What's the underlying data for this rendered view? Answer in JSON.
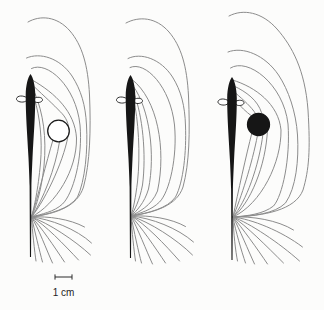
{
  "figure": {
    "background": "#fcfcfb",
    "line_color": "#8c8c8c",
    "line_width": 1,
    "outline_color": "#1a1a1a",
    "fish": {
      "color": "#161616",
      "fin_fill": "#ffffff",
      "body_path": "M 0,0 C 2.6,3.5 4.7,11 4.8,21 C 4.9,40 3.1,62 2,84 C 1.4,97 1.1,104 0.9,112 L 0.55,183 L -0.55,183 L -0.9,112 C -1.1,104 -1.4,97 -2,84 C -3.1,62 -4.9,40 -4.8,21 C -4.7,11 -2.6,3.5 0,0 Z",
      "left_fin_path": "M -3.2,24 C -7.5,21 -13,21.5 -14,24.5 C -14.6,27 -10,28.8 -6.2,27.8 C -4.2,27.2 -3.2,26 -3.2,24 Z",
      "right_fin_path": "M 3.2,24.5 C 7,22.5 11.2,23 12,25.5 C 12.4,27.8 8.2,29.2 5.2,28.2 C 3.8,27.6 3.1,26.3 3.2,24.5 Z"
    },
    "panels": [
      {
        "name": "nonconductive-object",
        "fish": {
          "x": 30.5,
          "y": 74
        },
        "object": {
          "shape": "circle",
          "cx": 58.5,
          "cy": 131,
          "r": 10.8,
          "fill": "#ffffff",
          "stroke": "#1a1a1a"
        },
        "field_lines": [
          "M 34.5,99 C 40,117 42.5,140 40.5,163 C 38,190 34.5,206 31.5,217",
          "M 35,93.5 C 43,113 46.8,137 44,166 C 41,193 35.5,208 31.5,217",
          "M 34.5,87 C 44,96 54,105 60,111.5 C 66,117 69.5,124 68.5,132.5 C 66,155 47,198 31.5,217",
          "M 52.8,140.5 C 46.5,162 38,196 31.5,217",
          "M 59.5,141.8 C 55.5,168 43,200 31.5,217",
          "M 33,80.5 C 55,93 75,112 76.5,138 C 77,170 56,204 31.5,217",
          "M 31.5,68.5 C 47,60.5 76,86 80,125 C 83,158 73,194 62.5,204 C 54,212 41.5,214 31.5,217",
          "M 26.5,58 C 40,52 60,58 72,76 C 81,90 85.5,105 86.5,125 C 88,150 85,181 77.5,197 C 69.5,209 49.5,214 31.5,217",
          "M 28,22 C 40,15 57,16 70,31 C 82,45 88,65 89.5,95 C 91,130 90,163 83.5,187 C 77.5,206 57.5,213.5 31.5,217",
          "M 31.5,217 C 48,216 70,219 84.5,227",
          "M 31.5,217 C 50,219 76.5,229 91.5,243",
          "M 31.5,217 C 48,223 74.5,240 90.5,255",
          "M 31.5,217 C 44.5,224 64.5,245 78.5,260",
          "M 31.5,217 C 40.5,226 54.5,247 64.5,262",
          "M 31.5,217 C 38.5,228 46.5,250 52.5,263",
          "M 31.5,217 C 34.5,230 39.5,251 42.5,262",
          "M 31.5,217 C 32.5,232 34.5,251 36,261"
        ]
      },
      {
        "name": "no-object",
        "fish": {
          "x": 130.5,
          "y": 75
        },
        "object": null,
        "field_lines": [
          "M 133.5,99.5 C 138.5,119 140.5,154 137.5,182 C 135.5,198 133.5,208 131,216",
          "M 134,93.5 C 142.5,115 146.5,154 142.5,185 C 139.5,201 134.5,210 131,216",
          "M 133.5,86.5 C 149.5,109 155.5,154 148.5,189 C 144.5,203 136.5,211 131,216",
          "M 132,79.5 C 157.5,99 166.5,149 157.5,191 C 151.5,206 138.5,212 131,216",
          "M 130,67.5 C 145.5,60.5 170.5,87 174.5,125 C 177.5,157 169.5,192 159.5,202 C 151.5,210 140.5,213 131,216",
          "M 128,58.5 C 141,52 161,59 172.5,77 C 181,90.5 185,106 185.5,126 C 186.5,151 183.5,182 175.5,197 C 167.5,208.5 148.5,213 131,216",
          "M 126,23 C 139,16 156,17 169,32 C 181,46 187,66 188.5,96 C 190,132 189.5,163 183,187 C 177,205 157,212 131,216",
          "M 131,216 C 149.5,215 171.5,218.5 185.5,226.5",
          "M 131,216 C 151.5,218 177.5,228 193.5,242",
          "M 131,216 C 149.5,222 176.5,239 192.5,255",
          "M 131,216 C 144.5,223 165.5,245 179.5,261",
          "M 131,216 C 140.5,226 155.5,248 165.5,263",
          "M 131,216 C 137.5,228 146.5,251 152.5,264",
          "M 131,216 C 134,231 138.5,252 141.5,263",
          "M 131,216 C 132,232 134,251 135.5,261"
        ]
      },
      {
        "name": "conductive-object",
        "fish": {
          "x": 232,
          "y": 77
        },
        "object": {
          "shape": "circle",
          "cx": 258.5,
          "cy": 124.5,
          "r": 11,
          "fill": "#161616",
          "stroke": "#161616"
        },
        "field_lines": [
          "M 235.5,100 C 240.5,107 246.5,112 251,115.5",
          "M 235.5,93 C 243.5,100 251.5,107 255.5,113.5",
          "M 234,86 C 246.5,92 257.5,100 261.5,112.5",
          "M 252,132.5 C 246,156 238,192 233,217",
          "M 257.5,135.3 C 252,164 241,198 233,217",
          "M 263,133.8 C 259,166 246,202 233,217",
          "M 267.5,129.5 C 266,166 250,204 233,217",
          "M 232.5,80 C 255.5,87 278.5,104 281,130 C 281.5,162 261.5,204 233,217",
          "M 230.5,68 C 247.5,57 283.5,84 288,124 C 290.5,158 282.5,196 273.5,206 C 263.5,214 247.5,216 233,217",
          "M 228,52 C 243,46 265,55 278.5,75 C 288.5,90 296,112 297.5,135 C 299,160 296,188 285.5,203 C 274.5,214 252.5,216 233,217",
          "M 229,16 C 243,8.5 262,12 277,29 C 292,46 305,70 308,110 C 310.5,150 309,170 303,190 C 295.5,210 264,216 233,217",
          "M 233,217 C 251.5,216 277.5,220 293.5,230",
          "M 233,217 C 251.5,219 281.5,231 302.5,247",
          "M 233,217 C 249.5,223 279.5,243 299.5,261",
          "M 233,217 C 245.5,225 267.5,247 283.5,263",
          "M 233,217 C 241.5,227 257.5,249 267.5,264",
          "M 233,217 C 239.5,229 248.5,251 254.5,264",
          "M 233,217 C 235.5,231 241.5,251 245.5,263",
          "M 233,217 C 233.5,233 235.5,251 237.5,261"
        ]
      }
    ],
    "scale_bar": {
      "x1": 55,
      "x2": 72,
      "y": 277,
      "tick_half_height": 2.6,
      "color": "#2b2b2b",
      "label": "1 cm",
      "label_x": 63.5,
      "label_y": 296,
      "label_size": 10,
      "label_color": "#1f1f1f"
    }
  }
}
